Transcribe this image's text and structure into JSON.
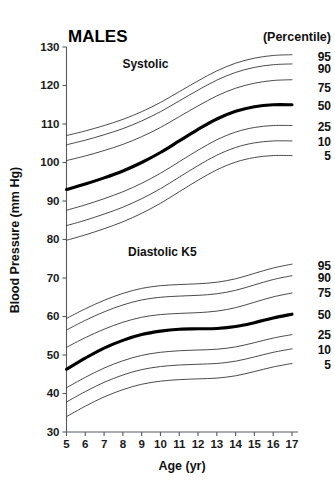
{
  "chart_data": {
    "type": "line",
    "title": "MALES",
    "xlabel": "Age (yr)",
    "ylabel": "Blood Pressure (mm Hg)",
    "legend_title": "(Percentile)",
    "legend_position": "right",
    "grid": false,
    "xlim": [
      5,
      17
    ],
    "ylim": [
      30,
      130
    ],
    "x": [
      5,
      6,
      7,
      8,
      9,
      10,
      11,
      12,
      13,
      14,
      15,
      16,
      17
    ],
    "xticks": [
      "5",
      "6",
      "7",
      "8",
      "9",
      "10",
      "11",
      "12",
      "13",
      "14",
      "15",
      "16",
      "17"
    ],
    "yticks": [
      "30",
      "40",
      "50",
      "60",
      "70",
      "80",
      "90",
      "100",
      "110",
      "120",
      "130"
    ],
    "groups": [
      {
        "name": "Systolic",
        "annotation": "Systolic",
        "annotation_x": 9.2,
        "annotation_y": 124.5,
        "series": [
          {
            "name": "95",
            "label": "95",
            "bold": false,
            "label_y": 127.2,
            "values": [
              107.0,
              108.2,
              109.6,
              111.2,
              113.2,
              115.6,
              118.4,
              121.2,
              123.8,
              125.8,
              127.1,
              127.8,
              128.0
            ]
          },
          {
            "name": "90",
            "label": "90",
            "bold": false,
            "label_y": 124.0,
            "values": [
              104.6,
              105.8,
              107.2,
              108.8,
              110.8,
              113.2,
              116.0,
              118.8,
              121.4,
              123.4,
              124.7,
              125.4,
              125.6
            ]
          },
          {
            "name": "75",
            "label": "75",
            "bold": false,
            "label_y": 119.2,
            "values": [
              100.5,
              101.7,
              103.1,
              104.7,
              106.7,
              109.1,
              111.9,
              114.7,
              117.3,
              119.3,
              120.6,
              121.3,
              121.5
            ]
          },
          {
            "name": "50",
            "label": "50",
            "bold": true,
            "label_y": 114.5,
            "values": [
              93.0,
              94.4,
              96.0,
              97.8,
              100.0,
              102.6,
              105.6,
              108.6,
              111.3,
              113.3,
              114.5,
              115.0,
              115.0
            ]
          },
          {
            "name": "25",
            "label": "25",
            "bold": false,
            "label_y": 109.0,
            "values": [
              87.6,
              89.0,
              90.6,
              92.4,
              94.6,
              97.2,
              100.2,
              103.2,
              105.9,
              107.9,
              109.1,
              109.6,
              109.6
            ]
          },
          {
            "name": "10",
            "label": "10",
            "bold": false,
            "label_y": 105.2,
            "values": [
              83.6,
              85.0,
              86.6,
              88.4,
              90.6,
              93.2,
              96.2,
              99.2,
              101.9,
              103.9,
              105.1,
              105.6,
              105.6
            ]
          },
          {
            "name": "5",
            "label": "5",
            "bold": false,
            "label_y": 101.4,
            "values": [
              79.8,
              81.2,
              82.8,
              84.6,
              86.8,
              89.4,
              92.4,
              95.4,
              98.1,
              100.1,
              101.3,
              101.8,
              101.8
            ]
          }
        ]
      },
      {
        "name": "Diastolic K5",
        "annotation": "Diastolic K5",
        "annotation_x": 10.1,
        "annotation_y": 75.6,
        "series": [
          {
            "name": "95",
            "label": "95",
            "bold": false,
            "label_y": 73.0,
            "values": [
              59.5,
              62.0,
              64.2,
              66.0,
              67.3,
              68.0,
              68.3,
              68.5,
              68.9,
              69.8,
              71.2,
              72.6,
              73.6
            ]
          },
          {
            "name": "90",
            "label": "90",
            "bold": false,
            "label_y": 69.8,
            "values": [
              56.5,
              59.0,
              61.2,
              63.0,
              64.3,
              65.0,
              65.3,
              65.5,
              65.9,
              66.8,
              68.2,
              69.6,
              70.6
            ]
          },
          {
            "name": "75",
            "label": "75",
            "bold": false,
            "label_y": 65.8,
            "values": [
              52.0,
              54.5,
              56.7,
              58.5,
              59.8,
              60.5,
              60.8,
              61.0,
              61.4,
              62.3,
              63.7,
              65.1,
              66.1
            ]
          },
          {
            "name": "50",
            "label": "50",
            "bold": true,
            "label_y": 60.2,
            "values": [
              46.3,
              49.2,
              51.8,
              53.8,
              55.3,
              56.2,
              56.7,
              56.8,
              56.9,
              57.4,
              58.4,
              59.6,
              60.6
            ]
          },
          {
            "name": "25",
            "label": "25",
            "bold": false,
            "label_y": 55.0,
            "values": [
              41.5,
              44.2,
              46.6,
              48.5,
              49.9,
              50.7,
              51.1,
              51.3,
              51.5,
              52.1,
              53.2,
              54.4,
              55.3
            ]
          },
          {
            "name": "10",
            "label": "10",
            "bold": false,
            "label_y": 51.2,
            "values": [
              37.8,
              40.5,
              42.9,
              44.8,
              46.2,
              47.0,
              47.4,
              47.6,
              47.8,
              48.4,
              49.5,
              50.7,
              51.6
            ]
          },
          {
            "name": "5",
            "label": "5",
            "bold": false,
            "label_y": 47.3,
            "values": [
              34.0,
              36.7,
              39.1,
              41.0,
              42.4,
              43.2,
              43.6,
              43.8,
              44.0,
              44.6,
              45.7,
              46.9,
              47.8
            ]
          }
        ]
      }
    ]
  }
}
